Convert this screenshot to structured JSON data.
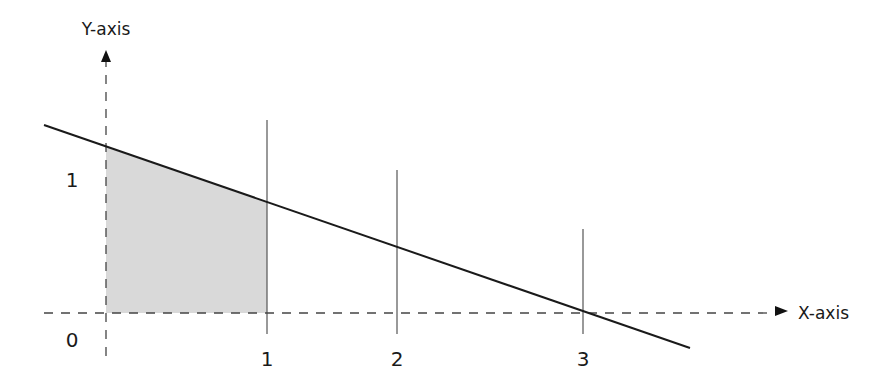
{
  "diagram": {
    "y_axis_label": "Y-axis",
    "x_axis_label": "X-axis",
    "y_ticks": [
      {
        "label": "1",
        "x": 72,
        "y": 187
      },
      {
        "label": "0",
        "x": 72,
        "y": 347
      }
    ],
    "x_ticks": [
      {
        "label": "1",
        "x": 267,
        "y": 366
      },
      {
        "label": "2",
        "x": 397,
        "y": 366
      },
      {
        "label": "3",
        "x": 583,
        "y": 366
      }
    ],
    "colors": {
      "line": "#1a1a1a",
      "shade": "#d9d9d9",
      "axis": "#444444",
      "gridline": "#555555"
    }
  }
}
